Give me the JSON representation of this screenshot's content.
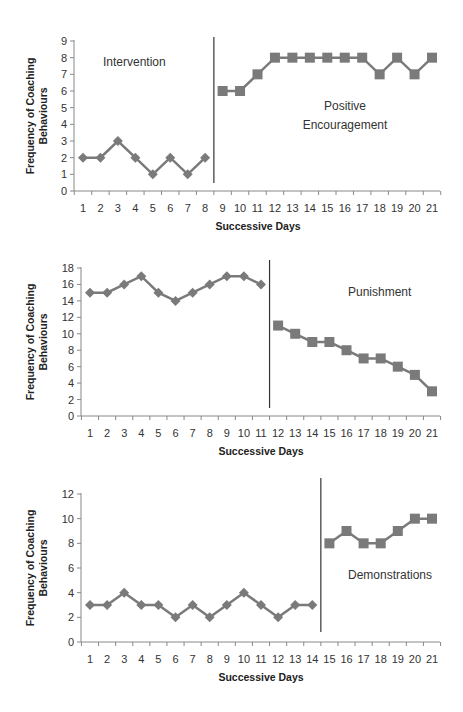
{
  "chart_data": [
    {
      "type": "line",
      "title": "",
      "xlabel": "Successive Days",
      "ylabel": "Frequency of Coaching Behaviours",
      "ylim": [
        0,
        9
      ],
      "yticks": [
        0,
        1,
        2,
        3,
        4,
        5,
        6,
        7,
        8,
        9
      ],
      "x": [
        1,
        2,
        3,
        4,
        5,
        6,
        7,
        8,
        9,
        10,
        11,
        12,
        13,
        14,
        15,
        16,
        17,
        18,
        19,
        20,
        21
      ],
      "grid": false,
      "series": [
        {
          "name": "Baseline",
          "marker": "diamond",
          "x": [
            1,
            2,
            3,
            4,
            5,
            6,
            7,
            8
          ],
          "values": [
            2,
            2,
            3,
            2,
            1,
            2,
            1,
            2
          ]
        },
        {
          "name": "Intervention",
          "marker": "square",
          "x": [
            9,
            10,
            11,
            12,
            13,
            14,
            15,
            16,
            17,
            18,
            19,
            20,
            21
          ],
          "values": [
            6,
            6,
            7,
            8,
            8,
            8,
            8,
            8,
            8,
            7,
            8,
            7,
            8
          ]
        }
      ],
      "phase_change_after_day": 8,
      "annotations": [
        "Intervention",
        "Positive",
        "Encouragement"
      ]
    },
    {
      "type": "line",
      "title": "",
      "xlabel": "Successive Days",
      "ylabel": "Frequency of Coaching Behaviours",
      "ylim": [
        0,
        18
      ],
      "yticks": [
        0,
        2,
        4,
        6,
        8,
        10,
        12,
        14,
        16,
        18
      ],
      "x": [
        1,
        2,
        3,
        4,
        5,
        6,
        7,
        8,
        9,
        10,
        11,
        12,
        13,
        14,
        15,
        16,
        17,
        18,
        19,
        20,
        21
      ],
      "grid": false,
      "series": [
        {
          "name": "Baseline",
          "marker": "diamond",
          "x": [
            1,
            2,
            3,
            4,
            5,
            6,
            7,
            8,
            9,
            10,
            11
          ],
          "values": [
            15,
            15,
            16,
            17,
            15,
            14,
            15,
            16,
            17,
            17,
            16
          ]
        },
        {
          "name": "Intervention",
          "marker": "square",
          "x": [
            12,
            13,
            14,
            15,
            16,
            17,
            18,
            19,
            20,
            21
          ],
          "values": [
            11,
            10,
            9,
            9,
            8,
            7,
            7,
            6,
            5,
            3
          ]
        }
      ],
      "phase_change_after_day": 11,
      "annotations": [
        "Punishment"
      ]
    },
    {
      "type": "line",
      "title": "",
      "xlabel": "Successive Days",
      "ylabel": "Frequency of Coaching Behaviours",
      "ylim": [
        0,
        12
      ],
      "yticks": [
        0,
        2,
        4,
        6,
        8,
        10,
        12
      ],
      "x": [
        1,
        2,
        3,
        4,
        5,
        6,
        7,
        8,
        9,
        10,
        11,
        12,
        13,
        14,
        15,
        16,
        17,
        18,
        19,
        20,
        21
      ],
      "grid": false,
      "series": [
        {
          "name": "Baseline",
          "marker": "diamond",
          "x": [
            1,
            2,
            3,
            4,
            5,
            6,
            7,
            8,
            9,
            10,
            11,
            12,
            13,
            14
          ],
          "values": [
            3,
            3,
            4,
            3,
            3,
            2,
            3,
            2,
            3,
            4,
            3,
            2,
            3,
            3
          ]
        },
        {
          "name": "Intervention",
          "marker": "square",
          "x": [
            15,
            16,
            17,
            18,
            19,
            20,
            21
          ],
          "values": [
            8,
            9,
            8,
            8,
            9,
            10,
            10
          ]
        }
      ],
      "phase_change_after_day": 14,
      "annotations": [
        "Demonstrations"
      ]
    }
  ],
  "labels": {
    "ylabel_line1": "Frequency of Coaching",
    "ylabel_line2": "Behaviours",
    "xlabel": "Successive Days",
    "chart1_label1": "Intervention",
    "chart1_label2a": "Positive",
    "chart1_label2b": "Encouragement",
    "chart2_label": "Punishment",
    "chart3_label": "Demonstrations"
  },
  "colors": {
    "series": "#7a7a7a",
    "axis": "#888888",
    "divider": "#333333"
  }
}
